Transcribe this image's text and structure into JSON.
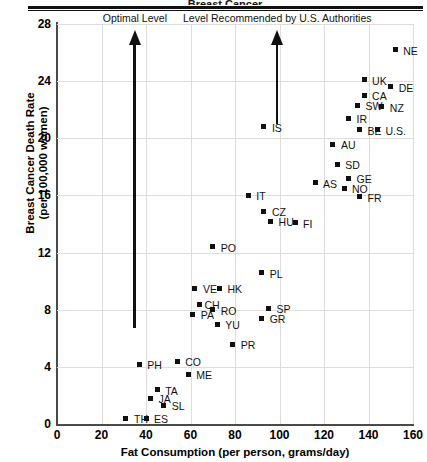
{
  "title_clipped": "Breast Cancer",
  "chart_data": {
    "type": "scatter",
    "title": "Breast Cancer",
    "xlabel": "Fat Consumption (per person, grams/day)",
    "ylabel_line1": "Breast Cancer Death Rate",
    "ylabel_line2": "(per 100,000 women)",
    "xlim": [
      0,
      160
    ],
    "ylim": [
      0,
      28
    ],
    "xticks": [
      0,
      20,
      40,
      60,
      80,
      100,
      120,
      140,
      160
    ],
    "yticks": [
      0,
      4,
      8,
      12,
      16,
      20,
      24,
      28
    ],
    "grid": true,
    "legend": "none",
    "points": [
      {
        "label": "NE",
        "x": 152,
        "y": 26.2,
        "lx": 8,
        "ly": -4
      },
      {
        "label": "UK",
        "x": 138,
        "y": 24.1,
        "lx": 8,
        "ly": -4
      },
      {
        "label": "DE",
        "x": 150,
        "y": 23.6,
        "lx": 8,
        "ly": -4
      },
      {
        "label": "CA",
        "x": 138,
        "y": 23.0,
        "lx": 8,
        "ly": -4
      },
      {
        "label": "SW",
        "x": 135,
        "y": 22.3,
        "lx": 8,
        "ly": -4
      },
      {
        "label": "NZ",
        "x": 146,
        "y": 22.2,
        "lx": 8,
        "ly": -4
      },
      {
        "label": "IR",
        "x": 131,
        "y": 21.4,
        "lx": 8,
        "ly": -4
      },
      {
        "label": "BE",
        "x": 136,
        "y": 20.6,
        "lx": 8,
        "ly": -4
      },
      {
        "label": "U.S.",
        "x": 144,
        "y": 20.6,
        "lx": 8,
        "ly": -4
      },
      {
        "label": "IS",
        "x": 93,
        "y": 20.8,
        "lx": 8,
        "ly": -4
      },
      {
        "label": "AU",
        "x": 124,
        "y": 19.6,
        "lx": 8,
        "ly": -4
      },
      {
        "label": "SD",
        "x": 126,
        "y": 18.2,
        "lx": 8,
        "ly": -4
      },
      {
        "label": "GE",
        "x": 131,
        "y": 17.2,
        "lx": 8,
        "ly": -4
      },
      {
        "label": "AS",
        "x": 116,
        "y": 16.9,
        "lx": 8,
        "ly": -4
      },
      {
        "label": "NO",
        "x": 129,
        "y": 16.5,
        "lx": 8,
        "ly": -4
      },
      {
        "label": "FR",
        "x": 136,
        "y": 15.9,
        "lx": 8,
        "ly": -4
      },
      {
        "label": "IT",
        "x": 86,
        "y": 16.0,
        "lx": 8,
        "ly": -4
      },
      {
        "label": "CZ",
        "x": 93,
        "y": 14.9,
        "lx": 8,
        "ly": -4
      },
      {
        "label": "HU",
        "x": 96,
        "y": 14.2,
        "lx": 8,
        "ly": -4
      },
      {
        "label": "FI",
        "x": 107,
        "y": 14.1,
        "lx": 8,
        "ly": -4
      },
      {
        "label": "PO",
        "x": 70,
        "y": 12.4,
        "lx": 8,
        "ly": -4
      },
      {
        "label": "PL",
        "x": 92,
        "y": 10.6,
        "lx": 8,
        "ly": -4
      },
      {
        "label": "VE",
        "x": 62,
        "y": 9.5,
        "lx": 8,
        "ly": -4
      },
      {
        "label": "HK",
        "x": 73,
        "y": 9.5,
        "lx": 8,
        "ly": -4
      },
      {
        "label": "CH",
        "x": 64,
        "y": 8.4,
        "lx": 5,
        "ly": -4
      },
      {
        "label": "RO",
        "x": 70,
        "y": 8.0,
        "lx": 8,
        "ly": -4
      },
      {
        "label": "SP",
        "x": 95,
        "y": 8.1,
        "lx": 8,
        "ly": -4
      },
      {
        "label": "PA",
        "x": 61,
        "y": 7.7,
        "lx": 8,
        "ly": -4
      },
      {
        "label": "GR",
        "x": 92,
        "y": 7.4,
        "lx": 8,
        "ly": -4
      },
      {
        "label": "YU",
        "x": 72,
        "y": 7.0,
        "lx": 8,
        "ly": -4
      },
      {
        "label": "PR",
        "x": 79,
        "y": 5.6,
        "lx": 8,
        "ly": -4
      },
      {
        "label": "CO",
        "x": 54,
        "y": 4.4,
        "lx": 8,
        "ly": -4
      },
      {
        "label": "PH",
        "x": 37,
        "y": 4.2,
        "lx": 8,
        "ly": -4
      },
      {
        "label": "ME",
        "x": 59,
        "y": 3.5,
        "lx": 8,
        "ly": -4
      },
      {
        "label": "TA",
        "x": 45,
        "y": 2.4,
        "lx": 8,
        "ly": -4
      },
      {
        "label": "JA",
        "x": 42,
        "y": 1.8,
        "lx": 8,
        "ly": -4
      },
      {
        "label": "SL",
        "x": 48,
        "y": 1.3,
        "lx": 8,
        "ly": -4
      },
      {
        "label": "TH",
        "x": 31,
        "y": 0.4,
        "lx": 8,
        "ly": -4
      },
      {
        "label": "ES",
        "x": 40,
        "y": 0.4,
        "lx": 8,
        "ly": -4
      }
    ],
    "annotations": [
      {
        "id": "optimal",
        "text": "Optimal Level",
        "x": 35,
        "y_from": 6.7,
        "y_to": 27.6,
        "label_x": 35,
        "label_align": "center"
      },
      {
        "id": "recommended",
        "text": "Level Recommended by U.S. Authorities",
        "x": 99,
        "y_from": 21.0,
        "y_to": 27.6,
        "label_x": 99,
        "label_align": "center"
      }
    ]
  }
}
